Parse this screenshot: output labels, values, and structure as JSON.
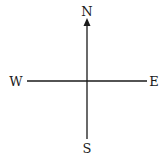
{
  "diagram": {
    "type": "compass",
    "colors": {
      "line": "#1a1a1a",
      "text": "#1a1a1a",
      "background": "#ffffff"
    },
    "center": {
      "x": 87,
      "y": 81
    },
    "directions": {
      "north": {
        "label": "N",
        "x": 87,
        "y": 11,
        "arrow": true
      },
      "south": {
        "label": "S",
        "x": 87,
        "y": 149,
        "arrow": false
      },
      "west": {
        "label": "W",
        "x": 15,
        "y": 81,
        "arrow": false
      },
      "east": {
        "label": "E",
        "x": 154,
        "y": 81,
        "arrow": false
      }
    }
  }
}
